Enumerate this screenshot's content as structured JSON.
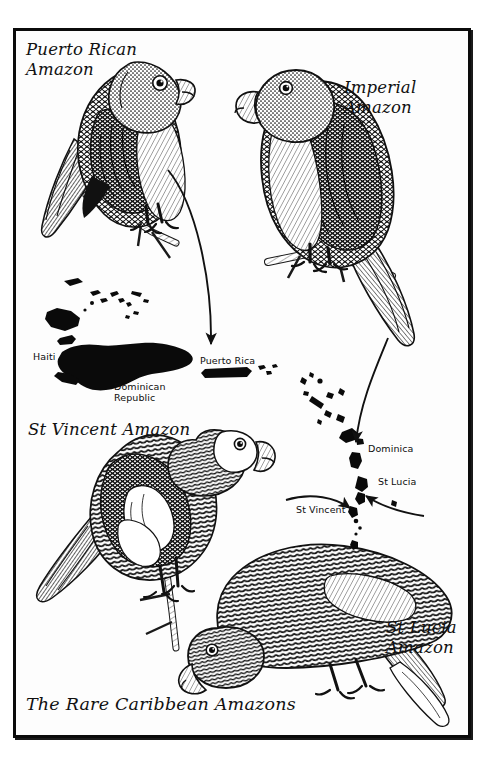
{
  "plate": {
    "title": "The Rare Caribbean Amazons",
    "medium": "pen-and-ink engraving plate",
    "frame_color": "#0b0b0b",
    "paper_color": "#ffffff",
    "ink_color": "#111111"
  },
  "bird_labels": {
    "puerto_rican": "Puerto Rican\nAmazon",
    "imperial": "Imperial Amazon",
    "st_vincent": "St Vincent Amazon",
    "st_lucia": "St Lucia\nAmazon"
  },
  "map_labels": {
    "haiti": "Haiti",
    "dominican_republic": "Dominican\nRepublic",
    "puerto_rica": "Puerto Rica",
    "dominica": "Dominica",
    "st_lucia": "St Lucia",
    "st_vincent": "St Vincent"
  },
  "arrows": [
    {
      "name": "puerto-rican-to-puerto-rico",
      "from": "Puerto Rican Amazon",
      "to": "Puerto Rica"
    },
    {
      "name": "imperial-to-dominica",
      "from": "Imperial Amazon",
      "to": "Dominica"
    },
    {
      "name": "st-vincent-to-st-vincent-island",
      "from": "St Vincent Amazon",
      "to": "St Vincent"
    },
    {
      "name": "st-lucia-to-st-lucia-island",
      "from": "St Lucia Amazon",
      "to": "St Lucia"
    }
  ],
  "birds": [
    {
      "name": "puerto-rican-amazon",
      "pose": "perched on branch, facing right"
    },
    {
      "name": "imperial-amazon",
      "pose": "perched on branch, facing left"
    },
    {
      "name": "st-vincent-amazon",
      "pose": "perched on branch, facing right"
    },
    {
      "name": "st-lucia-amazon",
      "pose": "perched, head lowered, facing left"
    }
  ]
}
